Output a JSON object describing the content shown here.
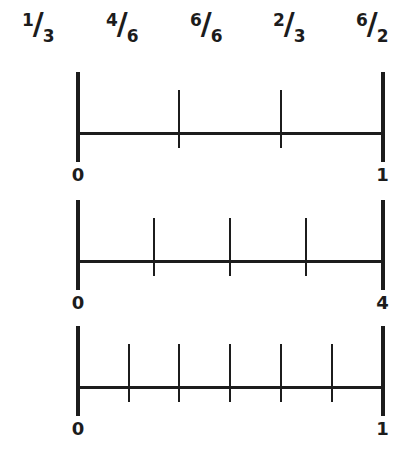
{
  "page": {
    "background": "#ffffff",
    "ink_color": "#1c1c1c"
  },
  "fractions_row": {
    "separator": "/",
    "items": [
      {
        "numerator": "1",
        "denominator": "3"
      },
      {
        "numerator": "4",
        "denominator": "6"
      },
      {
        "numerator": "6",
        "denominator": "6"
      },
      {
        "numerator": "2",
        "denominator": "3"
      },
      {
        "numerator": "6",
        "denominator": "2"
      }
    ]
  },
  "number_lines": [
    {
      "start_label": "0",
      "end_label": "1",
      "segments": 3,
      "division_tick_fractions": [
        0.3333,
        0.6667
      ]
    },
    {
      "start_label": "0",
      "end_label": "4",
      "segments": 4,
      "division_tick_fractions": [
        0.25,
        0.5,
        0.75
      ]
    },
    {
      "start_label": "0",
      "end_label": "1",
      "segments": 6,
      "division_tick_fractions": [
        0.1667,
        0.3333,
        0.5,
        0.6667,
        0.8333
      ]
    }
  ]
}
